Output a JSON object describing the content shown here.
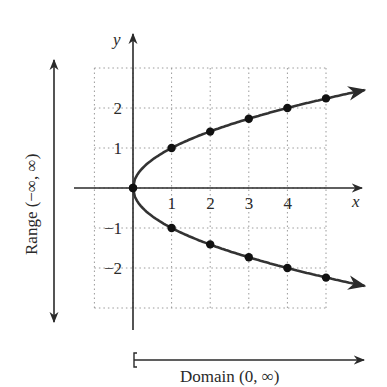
{
  "figure": {
    "title": "",
    "equation_hint": "x = y^2",
    "axes": {
      "x_label": "x",
      "y_label": "y",
      "x_ticks": [
        {
          "value": 1,
          "label": "1"
        },
        {
          "value": 2,
          "label": "2"
        },
        {
          "value": 3,
          "label": "3"
        },
        {
          "value": 4,
          "label": "4"
        }
      ],
      "y_ticks": [
        {
          "value": 2,
          "label": "2"
        },
        {
          "value": 1,
          "label": "1"
        },
        {
          "value": -1,
          "label": "−1"
        },
        {
          "value": -2,
          "label": "−2"
        }
      ]
    },
    "range_label": "Range (−∞, ∞)",
    "domain_label": "Domain (0, ∞)",
    "colors": {
      "curve": "#333333",
      "axis": "#2a2a2a",
      "grid": "#9a9a9a",
      "point": "#111111"
    }
  },
  "chart_data": {
    "type": "line",
    "title": "",
    "xlabel": "x",
    "ylabel": "y",
    "xlim": [
      -1,
      6
    ],
    "ylim": [
      -3,
      3
    ],
    "grid": true,
    "series": [
      {
        "name": "upper branch y = √x",
        "x": [
          0,
          1,
          2,
          3,
          4,
          5
        ],
        "y": [
          0,
          1,
          1.41,
          1.73,
          2,
          2.24
        ]
      },
      {
        "name": "lower branch y = −√x",
        "x": [
          0,
          1,
          2,
          3,
          4,
          5
        ],
        "y": [
          0,
          -1,
          -1.41,
          -1.73,
          -2,
          -2.24
        ]
      }
    ],
    "annotations": [
      "Range (−∞, ∞)",
      "Domain (0, ∞)"
    ]
  }
}
